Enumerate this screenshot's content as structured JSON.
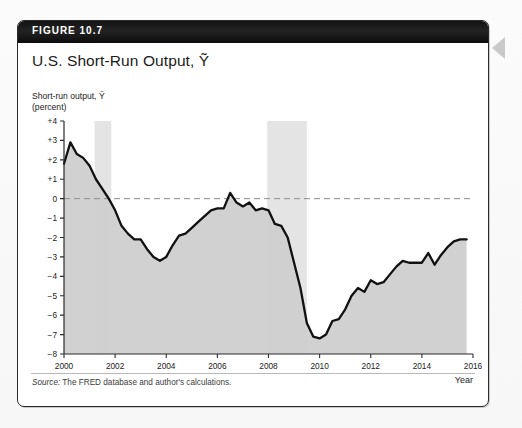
{
  "figure": {
    "banner_label": "FIGURE 10.7",
    "title": "U.S. Short-Run Output, Ỹ",
    "source_prefix": "Source:",
    "source_text": " The FRED database and author's calculations."
  },
  "chart_data": {
    "type": "line",
    "title": "U.S. Short-Run Output, Ỹ",
    "axis_caption": "Short-run output, Ỹ\n(percent)",
    "xlabel": "Year",
    "ylabel": "Short-run output, Ỹ (percent)",
    "xlim": [
      2000,
      2016
    ],
    "ylim": [
      -8,
      4
    ],
    "xticks": [
      2000,
      2002,
      2004,
      2006,
      2008,
      2010,
      2012,
      2014,
      2016
    ],
    "xtick_labels": [
      "2000",
      "2002",
      "2004",
      "2006",
      "2008",
      "2010",
      "2012",
      "2014",
      "2016"
    ],
    "yticks": [
      4,
      3,
      2,
      1,
      0,
      -1,
      -2,
      -3,
      -4,
      -5,
      -6,
      -7,
      -8
    ],
    "ytick_labels": [
      "+4",
      "+3",
      "+2",
      "+1",
      "0",
      "−1",
      "−2",
      "−3",
      "−4",
      "−5",
      "−6",
      "−7",
      "−8"
    ],
    "grid": false,
    "zero_line": true,
    "zero_line_style": "dashed",
    "legend": null,
    "colors": {
      "line": "#111111",
      "area_fill": "#cfcfcf",
      "recession_band": "#e4e4e4",
      "zero_line": "#8c8c8c",
      "axis": "#2b2b2b"
    },
    "recession_bands": [
      {
        "label": "2001 recession",
        "start": 2001.2,
        "end": 2001.85
      },
      {
        "label": "2008-09 recession",
        "start": 2007.95,
        "end": 2009.5
      }
    ],
    "series": [
      {
        "name": "Short-run output",
        "x": [
          2000.0,
          2000.25,
          2000.5,
          2000.75,
          2001.0,
          2001.25,
          2001.5,
          2001.75,
          2002.0,
          2002.25,
          2002.5,
          2002.75,
          2003.0,
          2003.25,
          2003.5,
          2003.75,
          2004.0,
          2004.25,
          2004.5,
          2004.75,
          2005.0,
          2005.25,
          2005.5,
          2005.75,
          2006.0,
          2006.25,
          2006.5,
          2006.75,
          2007.0,
          2007.25,
          2007.5,
          2007.75,
          2008.0,
          2008.25,
          2008.5,
          2008.75,
          2009.0,
          2009.25,
          2009.5,
          2009.75,
          2010.0,
          2010.25,
          2010.5,
          2010.75,
          2011.0,
          2011.25,
          2011.5,
          2011.75,
          2012.0,
          2012.25,
          2012.5,
          2012.75,
          2013.0,
          2013.25,
          2013.5,
          2013.75,
          2014.0,
          2014.25,
          2014.5,
          2014.75,
          2015.0,
          2015.25,
          2015.5,
          2015.75
        ],
        "y": [
          1.8,
          2.9,
          2.3,
          2.1,
          1.7,
          1.0,
          0.5,
          0.0,
          -0.6,
          -1.4,
          -1.8,
          -2.1,
          -2.1,
          -2.6,
          -3.0,
          -3.2,
          -3.0,
          -2.4,
          -1.9,
          -1.8,
          -1.5,
          -1.2,
          -0.9,
          -0.6,
          -0.5,
          -0.5,
          0.3,
          -0.2,
          -0.4,
          -0.2,
          -0.6,
          -0.5,
          -0.6,
          -1.3,
          -1.4,
          -2.0,
          -3.3,
          -4.6,
          -6.4,
          -7.1,
          -7.2,
          -7.0,
          -6.3,
          -6.2,
          -5.7,
          -5.0,
          -4.6,
          -4.8,
          -4.2,
          -4.4,
          -4.3,
          -3.9,
          -3.5,
          -3.2,
          -3.3,
          -3.3,
          -3.3,
          -2.8,
          -3.4,
          -2.9,
          -2.5,
          -2.2,
          -2.1,
          -2.1
        ]
      }
    ]
  }
}
